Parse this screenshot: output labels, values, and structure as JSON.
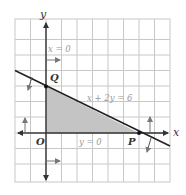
{
  "diagram": {
    "type": "linear-programming-feasible-region",
    "grid": {
      "columns": 10,
      "rows": 10,
      "origin_col": 2,
      "origin_row_from_top": 7
    },
    "axes": {
      "x_label": "x",
      "y_label": "y",
      "origin_label": "O"
    },
    "constraints": [
      {
        "equation": "x = 0",
        "direction": "right"
      },
      {
        "equation": "y = 0",
        "direction": "up"
      },
      {
        "equation": "x + 2y = 6",
        "direction": "down-left"
      }
    ],
    "points": [
      {
        "name": "Q",
        "x": 0,
        "y": 3
      },
      {
        "name": "P",
        "x": 6,
        "y": 0
      }
    ],
    "feasible_region": {
      "vertices": [
        [
          0,
          0
        ],
        [
          6,
          0
        ],
        [
          0,
          3
        ]
      ],
      "fill": "#c4c4c4"
    },
    "colors": {
      "grid": "#c8c8c8",
      "axis": "#333333",
      "line": "#222222",
      "label_gray": "#999999"
    }
  }
}
